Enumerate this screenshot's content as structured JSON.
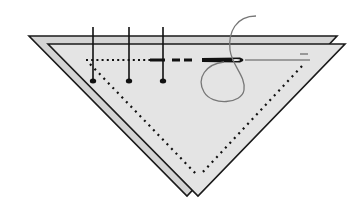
{
  "diagram": {
    "type": "sewing-illustration",
    "colors": {
      "background": "#ffffff",
      "fabric_back": "#d4d4d4",
      "fabric_front": "#e4e4e4",
      "outline": "#1a1a1a",
      "stitch": "#111111",
      "thread": "#777777"
    },
    "elements": {
      "fabric_back": "back fabric triangle",
      "fabric_front": "front fabric triangle",
      "seam_line": "dotted seam guide line",
      "pins": 3,
      "needle": "sewing needle with thread loop"
    }
  }
}
